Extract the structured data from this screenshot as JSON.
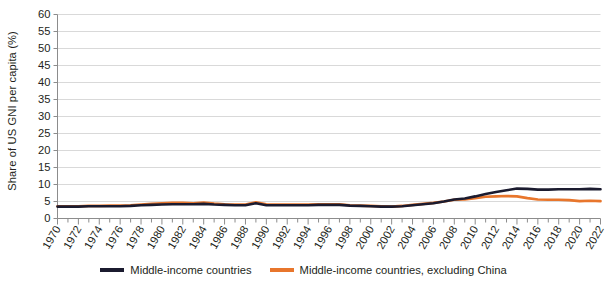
{
  "chart_data": {
    "type": "line",
    "title": "",
    "subtitle": "",
    "xlabel": "",
    "ylabel": "Share of US GNI per capita (%)",
    "xlim": [
      1970,
      2022
    ],
    "ylim": [
      0,
      60
    ],
    "ytick_step": 5,
    "xtick_step": 2,
    "grid": true,
    "grid_axis": "y",
    "legend_position": "bottom",
    "yticks": [
      0,
      5,
      10,
      15,
      20,
      25,
      30,
      35,
      40,
      45,
      50,
      55,
      60
    ],
    "ytick_labels": [
      "0",
      "5",
      "10",
      "15",
      "20",
      "25",
      "30",
      "35",
      "40",
      "45",
      "50",
      "55",
      "60"
    ],
    "xticks": [
      1970,
      1972,
      1974,
      1976,
      1978,
      1980,
      1982,
      1984,
      1986,
      1988,
      1990,
      1992,
      1994,
      1996,
      1998,
      2000,
      2002,
      2004,
      2006,
      2008,
      2010,
      2012,
      2014,
      2016,
      2018,
      2020,
      2022
    ],
    "xtick_labels": [
      "1970",
      "1972",
      "1974",
      "1976",
      "1978",
      "1980",
      "1982",
      "1984",
      "1986",
      "1988",
      "1990",
      "1992",
      "1994",
      "1996",
      "1998",
      "2000",
      "2002",
      "2004",
      "2006",
      "2008",
      "2010",
      "2012",
      "2014",
      "2016",
      "2018",
      "2020",
      "2022"
    ],
    "x": [
      1970,
      1971,
      1972,
      1973,
      1974,
      1975,
      1976,
      1977,
      1978,
      1979,
      1980,
      1981,
      1982,
      1983,
      1984,
      1985,
      1986,
      1987,
      1988,
      1989,
      1990,
      1991,
      1992,
      1993,
      1994,
      1995,
      1996,
      1997,
      1998,
      1999,
      2000,
      2001,
      2002,
      2003,
      2004,
      2005,
      2006,
      2007,
      2008,
      2009,
      2010,
      2011,
      2012,
      2013,
      2014,
      2015,
      2016,
      2017,
      2018,
      2019,
      2020,
      2021,
      2022
    ],
    "series": [
      {
        "name": "Middle-income countries",
        "color": "#1b1b2f",
        "values": [
          3.5,
          3.5,
          3.5,
          3.6,
          3.6,
          3.6,
          3.6,
          3.7,
          3.9,
          4.0,
          4.1,
          4.2,
          4.2,
          4.2,
          4.3,
          4.1,
          4.0,
          3.9,
          3.9,
          4.5,
          3.9,
          3.9,
          3.9,
          3.9,
          3.9,
          4.0,
          4.0,
          4.0,
          3.8,
          3.7,
          3.6,
          3.5,
          3.5,
          3.6,
          3.9,
          4.2,
          4.5,
          5.0,
          5.6,
          5.9,
          6.5,
          7.2,
          7.8,
          8.3,
          8.8,
          8.7,
          8.5,
          8.5,
          8.6,
          8.6,
          8.6,
          8.7,
          8.6
        ]
      },
      {
        "name": "Middle-income countries, excluding China",
        "color": "#e8762c",
        "values": [
          3.6,
          3.6,
          3.6,
          3.7,
          3.7,
          3.8,
          3.8,
          3.9,
          4.1,
          4.3,
          4.5,
          4.6,
          4.6,
          4.5,
          4.7,
          4.4,
          4.2,
          4.1,
          4.1,
          4.8,
          4.2,
          4.1,
          4.1,
          4.1,
          4.1,
          4.2,
          4.2,
          4.2,
          3.9,
          3.8,
          3.7,
          3.6,
          3.5,
          3.7,
          4.0,
          4.3,
          4.6,
          5.0,
          5.5,
          5.6,
          6.0,
          6.4,
          6.5,
          6.6,
          6.5,
          6.0,
          5.6,
          5.5,
          5.5,
          5.4,
          5.1,
          5.2,
          5.1
        ]
      }
    ]
  },
  "legend": {
    "entries": [
      {
        "label": "Middle-income countries",
        "color": "#1b1b2f"
      },
      {
        "label": "Middle-income countries, excluding China",
        "color": "#e8762c"
      }
    ]
  },
  "axis": {
    "y_title": "Share of US GNI per capita (%)"
  }
}
